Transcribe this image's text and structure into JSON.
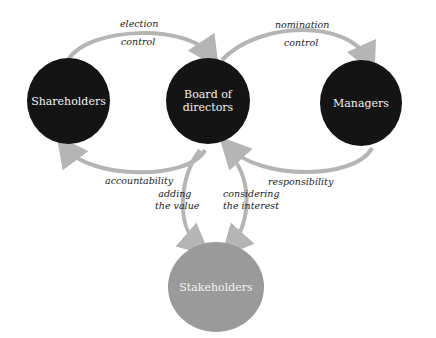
{
  "nodes": {
    "shareholders": "Shareholders",
    "board_line1": "Board of",
    "board_line2": "directors",
    "managers": "Managers",
    "stakeholders": "Stakeholders"
  },
  "edges": {
    "sh_to_board_1": "election",
    "sh_to_board_2": "control",
    "board_to_mgr_1": "nomination",
    "board_to_mgr_2": "control",
    "board_to_sh": "accountability",
    "mgr_to_board": "responsibility",
    "board_to_stake_1": "adding",
    "board_to_stake_2": "the value",
    "stake_to_board_1": "considering",
    "stake_to_board_2": "the interest"
  },
  "colors": {
    "node_dark": "#141414",
    "node_grey": "#9a9a9a",
    "arrow": "#b5b5b5"
  }
}
